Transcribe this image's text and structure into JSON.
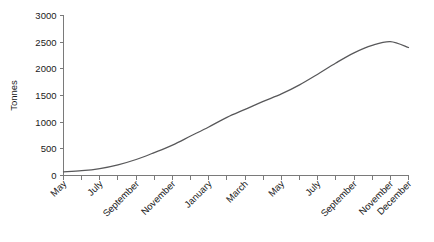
{
  "chart_data": {
    "type": "line",
    "title": "",
    "subtitle": "",
    "xlabel": "",
    "ylabel": "Tonnes",
    "ylim": [
      0,
      3000
    ],
    "xlim": [
      0,
      19
    ],
    "grid": false,
    "legend": null,
    "y_ticks": [
      0,
      500,
      1000,
      1500,
      2000,
      2500,
      3000
    ],
    "y_tick_labels": [
      "0",
      "500",
      "1000",
      "1500",
      "2000",
      "2500",
      "3000"
    ],
    "x_tick_count": 20,
    "x_tick_labels": [
      {
        "index": 0,
        "label": "May"
      },
      {
        "index": 2,
        "label": "July"
      },
      {
        "index": 4,
        "label": "September"
      },
      {
        "index": 6,
        "label": "November"
      },
      {
        "index": 8,
        "label": "January"
      },
      {
        "index": 10,
        "label": "March"
      },
      {
        "index": 12,
        "label": "May"
      },
      {
        "index": 14,
        "label": "July"
      },
      {
        "index": 16,
        "label": "September"
      },
      {
        "index": 18,
        "label": "November"
      },
      {
        "index": 19,
        "label": "December"
      }
    ],
    "categories": [
      "May",
      "June",
      "July",
      "August",
      "September",
      "October",
      "November",
      "December",
      "January",
      "February",
      "March",
      "April",
      "May",
      "June",
      "July",
      "August",
      "September",
      "October",
      "November",
      "December"
    ],
    "values": [
      70,
      90,
      130,
      200,
      300,
      430,
      570,
      740,
      910,
      1090,
      1240,
      1390,
      1530,
      1700,
      1900,
      2110,
      2300,
      2440,
      2510,
      2400
    ],
    "series": [
      {
        "name": "Tonnes",
        "color": "#58585a",
        "values": [
          70,
          90,
          130,
          200,
          300,
          430,
          570,
          740,
          910,
          1090,
          1240,
          1390,
          1530,
          1700,
          1900,
          2110,
          2300,
          2440,
          2510,
          2400
        ]
      }
    ],
    "colors": {
      "line": "#58585a",
      "axis": "#7a7a7a",
      "text": "#1a1a1a",
      "background": "#ffffff"
    }
  }
}
